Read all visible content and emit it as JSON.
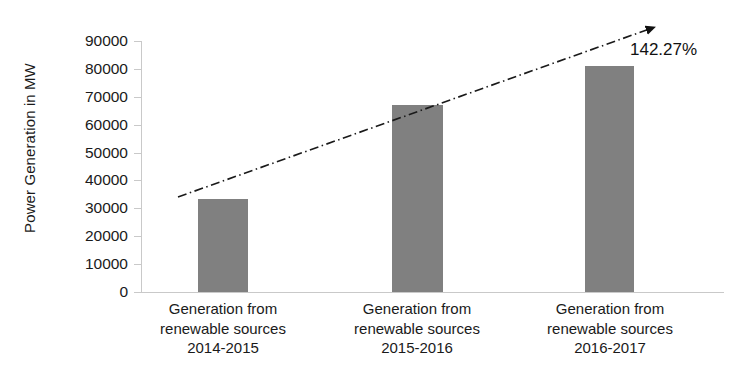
{
  "chart_data": {
    "type": "bar",
    "title": "",
    "subtitle": "",
    "xlabel": "",
    "ylabel": "Power Generation in MW",
    "ylim": [
      0,
      90000
    ],
    "yticks": [
      0,
      10000,
      20000,
      30000,
      40000,
      50000,
      60000,
      70000,
      80000,
      90000
    ],
    "ytick_labels": [
      "0",
      "10000",
      "20000",
      "30000",
      "40000",
      "50000",
      "60000",
      "70000",
      "80000",
      "90000"
    ],
    "grid": false,
    "legend": false,
    "legend_position": "none",
    "categories": [
      "Generation from renewable sources 2014-2015",
      "Generation from renewable sources 2015-2016",
      "Generation from renewable sources 2016-2017"
    ],
    "category_lines": [
      [
        "Generation from",
        "renewable sources",
        "2014-2015"
      ],
      [
        "Generation from",
        "renewable sources",
        "2015-2016"
      ],
      [
        "Generation from",
        "renewable sources",
        "2016-2017"
      ]
    ],
    "values": [
      33400,
      67000,
      80900
    ],
    "series": [
      {
        "name": "Power Generation",
        "values": [
          33400,
          67000,
          80900
        ],
        "color": "#808080"
      }
    ],
    "annotations": [
      {
        "text": "142.27%",
        "kind": "growth-trendline-label",
        "color": "#111111"
      }
    ],
    "trendline": {
      "style": "dash-dot",
      "color": "#1a1a1a",
      "arrow": "filled-triangle-end",
      "from": [
        178,
        197
      ],
      "to": [
        655,
        27
      ]
    },
    "colors": {
      "bar": "#808080",
      "axis": "#c9c9c9",
      "text": "#1a1a1a",
      "trend": "#1a1a1a"
    }
  },
  "axis": {
    "y_title": "Power Generation in MW"
  },
  "growth": {
    "label": "142.27%"
  }
}
